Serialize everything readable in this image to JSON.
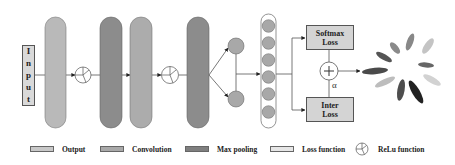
{
  "diagram": {
    "input_label": [
      "I",
      "n",
      "p",
      "u",
      "t"
    ],
    "softmax_box": {
      "line1": "Softmax",
      "line2": "Loss"
    },
    "inter_box": {
      "line1": "Inter",
      "line2": "Loss"
    },
    "alpha_label": "α",
    "plus_symbol": "+",
    "layers": [
      {
        "type": "Output",
        "color": "#b9b9b9"
      },
      {
        "type": "ReLu function"
      },
      {
        "type": "Max pooling",
        "color": "#8c8c8c"
      },
      {
        "type": "Convolution",
        "color": "#acacac"
      },
      {
        "type": "ReLu function"
      },
      {
        "type": "Max pooling",
        "color": "#8c8c8c"
      }
    ],
    "fc_nodes": 6,
    "branch_nodes": 2
  },
  "legend": {
    "items": [
      {
        "label": "Output",
        "color": "#c8c8c8"
      },
      {
        "label": "Convolution",
        "color": "#a9a9a9"
      },
      {
        "label": "Max pooling",
        "color": "#7f7f7f"
      },
      {
        "label": "Loss function",
        "color": "#e6e6e6"
      },
      {
        "label": "ReLu function",
        "icon": "relu-icon"
      }
    ]
  },
  "colors": {
    "output": "#b9b9b9",
    "convolution": "#acacac",
    "max_pooling": "#8c8c8c",
    "loss_function": "#d4d4d4",
    "node": "#a8a8a8",
    "line": "#555555"
  }
}
